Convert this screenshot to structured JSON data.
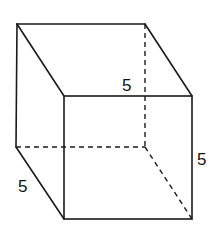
{
  "diagram": {
    "type": "cube",
    "title": "",
    "labels": {
      "top_edge": "5",
      "right_edge": "5",
      "depth_edge": "5"
    },
    "colors": {
      "line": "#1a1a1a",
      "background": "#ffffff"
    }
  }
}
